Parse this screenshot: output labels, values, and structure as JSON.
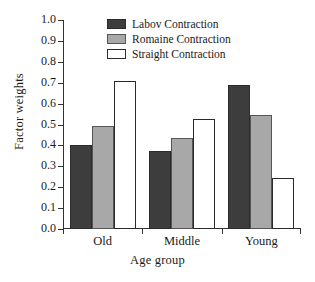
{
  "chart_data": {
    "type": "bar",
    "title": "",
    "xlabel": "Age group",
    "ylabel": "Factor weights",
    "categories": [
      "Old",
      "Middle",
      "Young"
    ],
    "series": [
      {
        "name": "Labov Contraction",
        "color": "#3d3d3d",
        "values": [
          0.4,
          0.375,
          0.69
        ]
      },
      {
        "name": "Romaine Contraction",
        "color": "#a8a8a8",
        "values": [
          0.495,
          0.435,
          0.545
        ]
      },
      {
        "name": "Straight Contraction",
        "color": "#ffffff",
        "values": [
          0.71,
          0.525,
          0.245
        ]
      }
    ],
    "ylim": [
      0.0,
      1.0
    ],
    "ytick_labels": [
      "0.0",
      "0.1",
      "0.2",
      "0.3",
      "0.4",
      "0.5",
      "0.6",
      "0.7",
      "0.8",
      "0.9",
      "1.0"
    ],
    "ytick_values": [
      0.0,
      0.1,
      0.2,
      0.3,
      0.4,
      0.5,
      0.6,
      0.7,
      0.8,
      0.9,
      1.0
    ],
    "grid": false,
    "legend_position": "top-center",
    "axis_color": "#333333",
    "background": "#ffffff"
  }
}
